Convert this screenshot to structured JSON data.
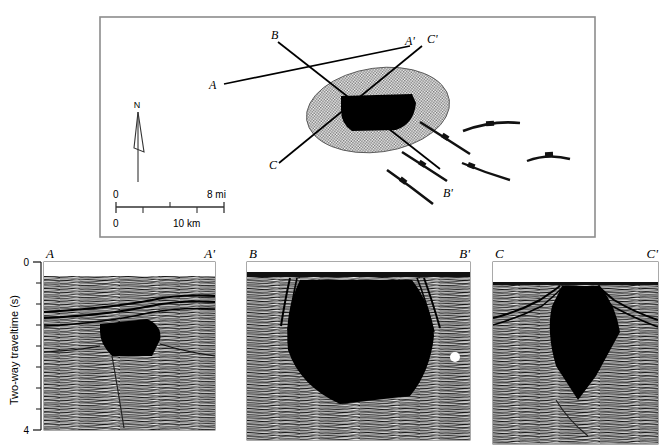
{
  "figure": {
    "type": "seismic-interpretation-figure"
  },
  "map": {
    "name": "index-map",
    "box": {
      "x": 100,
      "y": 17,
      "width": 495,
      "height": 220
    },
    "north_arrow": {
      "label": "N"
    },
    "scale_bar": {
      "top_left_label": "0",
      "top_right_label": "8 mi",
      "bottom_left_label": "0",
      "bottom_center_label": "10 km"
    },
    "section_line_labels": {
      "a_start": "A",
      "a_end": "A'",
      "b_start": "B",
      "b_end": "B'",
      "c_start": "C",
      "c_end": "C'"
    },
    "colors": {
      "line": "#000000",
      "stipple_fill": "#b9b9b9",
      "body_fill": "#000000",
      "border": "#8c8c8c"
    }
  },
  "axis": {
    "title": "Two-way traveltime (s)",
    "ticks": [
      "0",
      "4"
    ],
    "minor_tick_count": 7
  },
  "sections": [
    {
      "name": "section-a",
      "left_label": "A",
      "right_label": "A'",
      "x": 44,
      "y": 262,
      "width": 171,
      "height": 168
    },
    {
      "name": "section-b",
      "left_label": "B",
      "right_label": "B'",
      "x": 247,
      "y": 262,
      "width": 223,
      "height": 178
    },
    {
      "name": "section-c",
      "left_label": "C",
      "right_label": "C'",
      "x": 493,
      "y": 262,
      "width": 165,
      "height": 182
    }
  ],
  "annotations": {
    "white_spot": {
      "name": "white-spot-marker",
      "x": 455,
      "y": 357,
      "r": 5
    }
  }
}
